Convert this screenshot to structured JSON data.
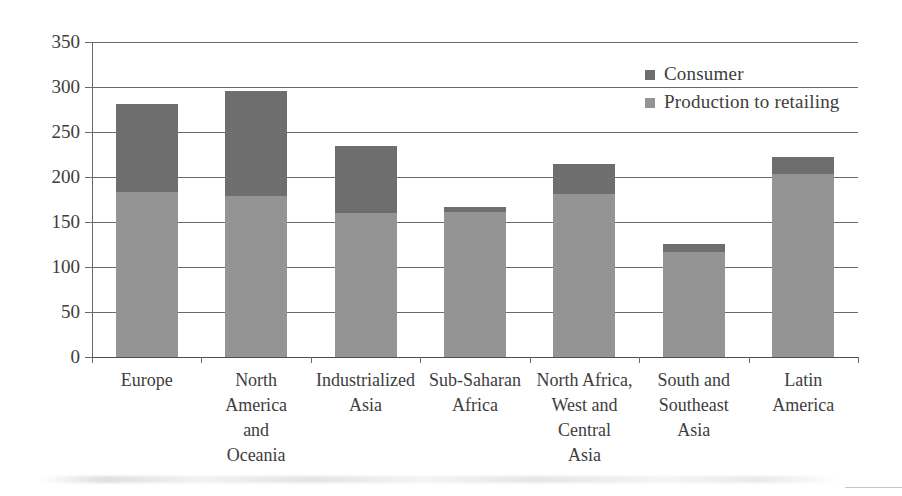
{
  "chart_data": {
    "type": "bar",
    "stacked": true,
    "title": "",
    "subtitle": "",
    "xlabel": "",
    "ylabel": "",
    "ylim": [
      0,
      350
    ],
    "ytick_step": 50,
    "yticks": [
      0,
      50,
      100,
      150,
      200,
      250,
      300,
      350
    ],
    "grid": true,
    "grid_axis": "y",
    "legend_position": "top-right",
    "categories": [
      "Europe",
      "North America and Oceania",
      "Industrialized Asia",
      "Sub-Saharan Africa",
      "North Africa, West and Central Asia",
      "South and Southeast Asia",
      "Latin America"
    ],
    "category_lines": [
      [
        "Europe"
      ],
      [
        "North",
        "America",
        "and",
        "Oceania"
      ],
      [
        "Industrialized",
        "Asia"
      ],
      [
        "Sub-Saharan",
        "Africa"
      ],
      [
        "North Africa,",
        "West and",
        "Central",
        "Asia"
      ],
      [
        "South and",
        "Southeast",
        "Asia"
      ],
      [
        "Latin",
        "America"
      ]
    ],
    "series": [
      {
        "name": "Production to retailing",
        "color": "#949494",
        "values": [
          183,
          179,
          160,
          161,
          181,
          117,
          203
        ]
      },
      {
        "name": "Consumer",
        "color": "#6e6e6e",
        "values": [
          98,
          117,
          74,
          6,
          34,
          9,
          19
        ]
      }
    ],
    "totals": [
      281,
      296,
      234,
      167,
      215,
      126,
      222
    ]
  },
  "legend": {
    "items": [
      {
        "label": "Consumer",
        "color": "#6e6e6e"
      },
      {
        "label": "Production to retailing",
        "color": "#949494"
      }
    ]
  },
  "axis": {
    "y_labels": [
      "350",
      "300",
      "250",
      "200",
      "150",
      "100",
      "50",
      "0"
    ]
  }
}
